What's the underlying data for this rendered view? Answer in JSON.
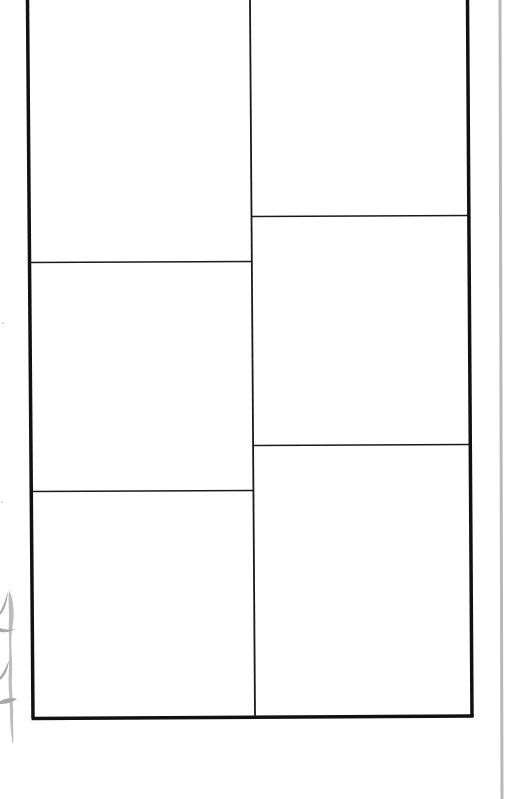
{
  "page": {
    "type": "comic storyboard template",
    "background": "#ffffff",
    "frame_color": "#111111",
    "divider_color": "#1a1a1a",
    "page_edge_color": "#b8b8b8",
    "doodle_color": "#bdbdbd"
  },
  "layout": {
    "columns": 2,
    "panels": [
      {
        "id": "panel-1",
        "column": "left",
        "row": 1,
        "label": ""
      },
      {
        "id": "panel-2",
        "column": "left",
        "row": 2,
        "label": ""
      },
      {
        "id": "panel-3",
        "column": "left",
        "row": 3,
        "label": ""
      },
      {
        "id": "panel-4",
        "column": "right",
        "row": 1,
        "label": ""
      },
      {
        "id": "panel-5",
        "column": "right",
        "row": 2,
        "label": ""
      },
      {
        "id": "panel-6",
        "column": "right",
        "row": 3,
        "label": ""
      }
    ]
  },
  "icons": {
    "doodle": "squiggle-doodle-icon"
  }
}
